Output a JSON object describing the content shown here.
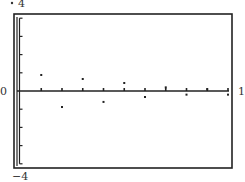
{
  "chart_data": {
    "type": "scatter",
    "title": "",
    "xlabel": "",
    "ylabel": "",
    "xlim": [
      0,
      1
    ],
    "ylim": [
      -4,
      4
    ],
    "grid": false,
    "legend": "none",
    "axis_labels": {
      "y_top": "4",
      "y_bottom": "-4",
      "x_left": "0",
      "x_right": "1"
    },
    "x_ticks": [
      0.1,
      0.2,
      0.3,
      0.4,
      0.5,
      0.6,
      0.7,
      0.8,
      0.9,
      1.0
    ],
    "y_ticks": [
      -4,
      -3,
      -2,
      -1,
      0,
      1,
      2,
      3,
      4
    ],
    "series": [
      {
        "name": "points",
        "x": [
          0.1,
          0.2,
          0.3,
          0.4,
          0.5,
          0.6,
          0.7,
          0.8,
          0.9,
          1.0
        ],
        "y": [
          0.88,
          -0.88,
          0.66,
          -0.6,
          0.44,
          -0.33,
          0.2,
          -0.2,
          0.1,
          -0.2
        ]
      }
    ]
  },
  "labels": {
    "y_top": "4",
    "y_bottom": "−4",
    "x_left": "0",
    "x_right": "1"
  }
}
